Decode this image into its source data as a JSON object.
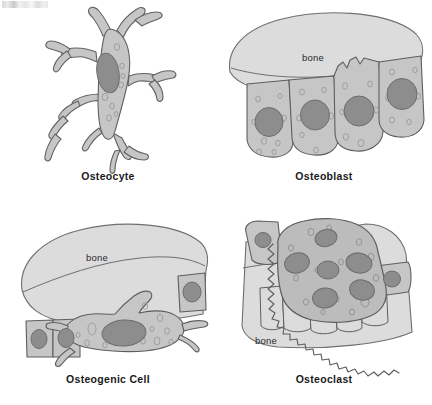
{
  "figure": {
    "type": "biology-diagram",
    "background_color": "#ffffff",
    "ink_color": "#4f4f4f",
    "cytoplasm_color": "#c6c6c6",
    "nucleus_color": "#8d8d8d",
    "bone_matrix_color": "#dcdcdc",
    "label_color": "#1a1a1a"
  },
  "panels": [
    {
      "id": "osteocyte",
      "label": "Osteocyte",
      "bone_label": null,
      "description": "Star-shaped cell with long branching cytoplasmic processes and one oval nucleus",
      "nuclei_count": 1,
      "processes_count": 8
    },
    {
      "id": "osteoblast",
      "label": "Osteoblast",
      "bone_label": "bone",
      "description": "Row of four cuboidal cells lining the under surface of a bone mass",
      "cells_count": 4,
      "nuclei_count": 4
    },
    {
      "id": "osteogenic",
      "label": "Osteogenic Cell",
      "bone_label": "bone",
      "description": "Large flattened elongated cell beneath bone, flanked by two small square cells",
      "cells_count": 4,
      "nuclei_count": 4
    },
    {
      "id": "osteoclast",
      "label": "Osteoclast",
      "bone_label": "bone",
      "description": "Large multinucleated cell with a ruffled border resting in a resorption bay in bone",
      "nuclei_count": 6,
      "has_ruffled_border": true
    }
  ]
}
